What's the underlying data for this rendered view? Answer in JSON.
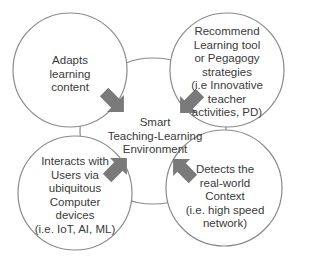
{
  "diagram": {
    "center": {
      "label": "Smart\nTeaching-Learning\nEnvironment"
    },
    "nodes": [
      {
        "id": "top-left",
        "label": "Adapts\nlearning\ncontent"
      },
      {
        "id": "top-right",
        "label": "Recommend\nLearning tool\nor Pegagogy\nstrategies\n(i.e Innovative\nteacher\nactivities, PD)"
      },
      {
        "id": "bottom-left",
        "label": "Interacts with\nUsers via\nubiquitous\nComputer\ndevices\n(i.e. IoT, AI, ML)"
      },
      {
        "id": "bottom-right",
        "label": "Detects the\nreal-world\nContext\n(i.e. high speed\nnetwork)"
      }
    ],
    "arrows": [
      {
        "from": "top-left",
        "to": "center",
        "direction": "down-right"
      },
      {
        "from": "top-right",
        "to": "center",
        "direction": "down-left"
      },
      {
        "from": "bottom-left",
        "to": "center",
        "direction": "up-right"
      },
      {
        "from": "bottom-right",
        "to": "center",
        "direction": "up-left"
      }
    ],
    "colors": {
      "stroke": "#8a8a8a",
      "arrow": "#7a7a7a",
      "text": "#3a3a3a",
      "background": "#ffffff"
    }
  }
}
